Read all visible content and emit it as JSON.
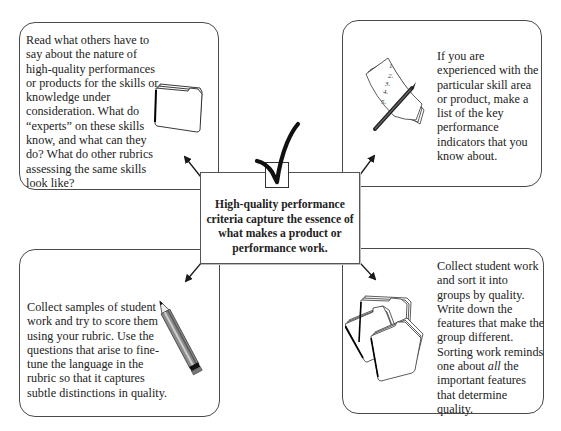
{
  "diagram": {
    "center": {
      "lines": [
        "High-quality performance",
        "criteria capture the essence of",
        "what makes a product or",
        "performance work."
      ],
      "icon": "checkmark-in-box-icon"
    },
    "boxes": {
      "top_left": {
        "icon": "file-folders-icon",
        "lines": [
          "Read what others have to",
          "say about the nature of",
          "high-quality performances",
          "or products for the skills or",
          "knowledge under",
          "consideration. What do",
          "“experts” on these skills",
          "know, and what can they",
          "do? What do other rubrics",
          "assessing the same skills",
          "look like?"
        ]
      },
      "top_right": {
        "icon": "numbered-list-with-pencil-icon",
        "list_numbers": [
          "1.",
          "2.",
          "3.",
          "4.",
          "5."
        ],
        "lines": [
          "If you are",
          "experienced with the",
          "particular skill area",
          "or product, make a",
          "list of the key",
          "performance",
          "indicators that you",
          "know about."
        ]
      },
      "bottom_left": {
        "icon": "pencil-icon",
        "lines": [
          "Collect samples of student",
          "work and try to score them",
          "using your rubric. Use the",
          "questions that arise to fine-",
          "tune the language in the",
          "rubric so that it captures",
          "subtle distinctions in quality."
        ]
      },
      "bottom_right": {
        "icon": "sorted-folders-icon",
        "lines": [
          "Collect student work",
          "and sort it into",
          "groups by quality.",
          "Write down the",
          "features that make the",
          "group different.",
          "Sorting work reminds",
          "one about |all| the",
          "important features",
          "that determine",
          "quality."
        ],
        "line8_before": "one about ",
        "line8_italic": "all",
        "line8_after": " the"
      }
    },
    "colors": {
      "border": "#4a4a4a",
      "text": "#222222",
      "arrow": "#1a1a1a",
      "background": "#ffffff"
    }
  }
}
